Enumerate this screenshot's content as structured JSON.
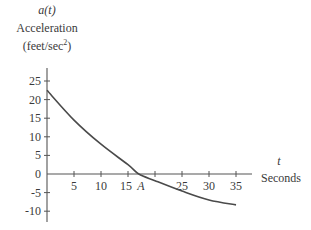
{
  "chart_data": {
    "type": "line",
    "title": "",
    "ylabel": {
      "function": "a(t)",
      "name": "Acceleration",
      "units_prefix": "(feet/sec",
      "units_sup": "2",
      "units_suffix": ")"
    },
    "xlabel": {
      "variable": "t",
      "name": "Seconds"
    },
    "x_ticks": [
      5,
      10,
      15,
      20,
      25,
      30,
      35
    ],
    "x_tick_labels": [
      "5",
      "10",
      "15",
      "",
      "25",
      "30",
      "35"
    ],
    "annotation": {
      "label": "A",
      "x": 17,
      "note": "zero crossing of a(t)"
    },
    "y_ticks": [
      25,
      20,
      15,
      10,
      5,
      0,
      -5,
      -10
    ],
    "y_tick_labels": [
      "25",
      "20",
      "15",
      "10",
      "5",
      "0",
      "-5",
      "-10"
    ],
    "xlim": [
      0,
      37
    ],
    "ylim": [
      -11,
      27
    ],
    "grid": false,
    "series": [
      {
        "name": "a(t)",
        "x": [
          0,
          5,
          10,
          15,
          17,
          20,
          25,
          30,
          35
        ],
        "y": [
          22.5,
          14.5,
          8,
          2.5,
          0,
          -1.8,
          -4.6,
          -7.0,
          -8.3
        ]
      }
    ]
  }
}
